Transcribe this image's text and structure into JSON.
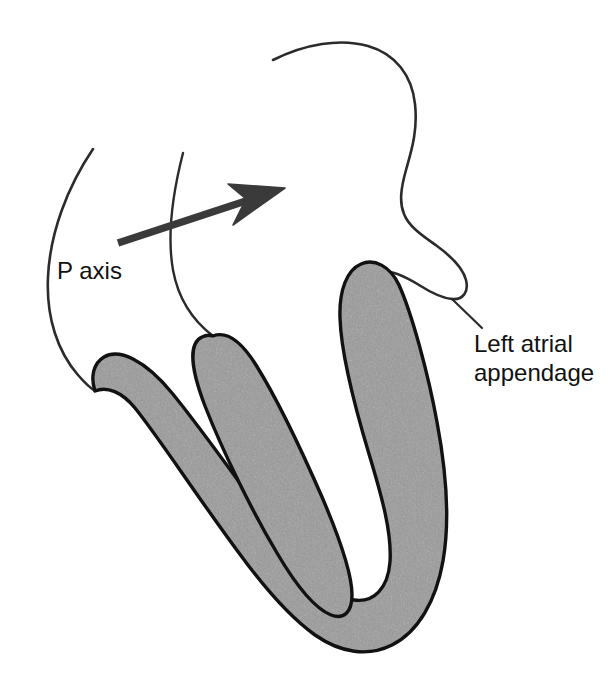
{
  "figure": {
    "background_color": "#ffffff",
    "width": 612,
    "height": 696
  },
  "labels": {
    "p_axis": "P axis",
    "left_atrial_appendage_line1": "Left atrial",
    "left_atrial_appendage_line2": "appendage"
  },
  "colors": {
    "myocardium_fill": "#9a9a9a",
    "myocardium_stroke": "#111111",
    "outline_stroke": "#2b2b2b",
    "arrow_color": "#3a3a3a",
    "text_color": "#111111",
    "leader_line": "#2b2b2b"
  },
  "annotations": {
    "arrow": {
      "name": "p-axis-vector-arrow",
      "tail": [
        118,
        243
      ],
      "tip": [
        285,
        188
      ],
      "direction": "up-and-to-the-right",
      "shaft_width_px": 7
    },
    "leader_line": {
      "name": "left-atrial-appendage-leader",
      "from": [
        452,
        299
      ],
      "to": [
        481,
        327
      ]
    }
  },
  "structures": [
    {
      "name": "left-ventricular-free-wall",
      "shaded": true
    },
    {
      "name": "interventricular-septum",
      "shaded": true
    },
    {
      "name": "right-ventricular-wall",
      "shaded": true
    },
    {
      "name": "cardiac-apex",
      "shaded": true
    },
    {
      "name": "left-atrium-outline",
      "shaded": false
    },
    {
      "name": "interatrial-septum-outline",
      "shaded": false
    },
    {
      "name": "right-atrium-outline",
      "shaded": false
    },
    {
      "name": "left-atrial-appendage-outline",
      "shaded": false
    }
  ]
}
